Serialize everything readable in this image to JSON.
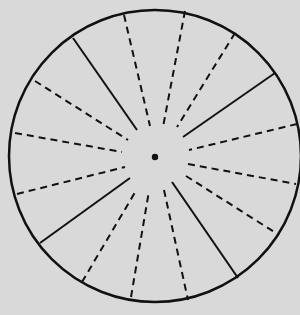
{
  "diagram": {
    "background": "#d9d9d9",
    "stroke_color": "#111111",
    "circle": {
      "cx": 155,
      "cy": 156,
      "r": 146,
      "stroke_width": 2.5
    },
    "center_dot": {
      "cx": 155,
      "cy": 157,
      "r": 3.2
    },
    "dash_pattern": "7,5",
    "lines": [
      {
        "style": "solid",
        "x1": 73,
        "y1": 38,
        "x2": 137,
        "y2": 130
      },
      {
        "style": "dashed",
        "x1": 35,
        "y1": 81,
        "x2": 128,
        "y2": 140
      },
      {
        "style": "dashed",
        "x1": 15,
        "y1": 133,
        "x2": 122,
        "y2": 152
      },
      {
        "style": "dashed",
        "x1": 124,
        "y1": 15,
        "x2": 150,
        "y2": 126
      },
      {
        "style": "dashed",
        "x1": 185,
        "y1": 11,
        "x2": 163,
        "y2": 127
      },
      {
        "style": "dashed",
        "x1": 235,
        "y1": 33,
        "x2": 177,
        "y2": 127
      },
      {
        "style": "solid",
        "x1": 275,
        "y1": 73,
        "x2": 183,
        "y2": 137
      },
      {
        "style": "dashed",
        "x1": 297,
        "y1": 124,
        "x2": 189,
        "y2": 150
      },
      {
        "style": "dashed",
        "x1": 17,
        "y1": 194,
        "x2": 125,
        "y2": 167
      },
      {
        "style": "solid",
        "x1": 40,
        "y1": 243,
        "x2": 130,
        "y2": 178
      },
      {
        "style": "dashed",
        "x1": 82,
        "y1": 282,
        "x2": 137,
        "y2": 189
      },
      {
        "style": "dashed",
        "x1": 131,
        "y1": 297,
        "x2": 149,
        "y2": 191
      },
      {
        "style": "dashed",
        "x1": 188,
        "y1": 164,
        "x2": 296,
        "y2": 184
      },
      {
        "style": "dashed",
        "x1": 186,
        "y1": 176,
        "x2": 279,
        "y2": 235
      },
      {
        "style": "solid",
        "x1": 172,
        "y1": 182,
        "x2": 238,
        "y2": 278
      },
      {
        "style": "dashed",
        "x1": 164,
        "y1": 190,
        "x2": 188,
        "y2": 300
      }
    ]
  }
}
